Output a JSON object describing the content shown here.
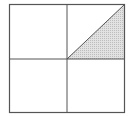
{
  "diagram": {
    "type": "geometric-figure",
    "description": "Square divided into four equal quadrants; the upper-right quadrant is split by a diagonal from the center to the top-right corner, and the lower triangle of that quadrant is shaded.",
    "square": {
      "x1": 9.5,
      "y1": 4.5,
      "x2": 124.5,
      "y2": 112.5
    },
    "center": {
      "x": 67,
      "y": 59
    },
    "stroke_color": "#555555",
    "shade_color": "#e2e2e2",
    "shade_dot_color": "#bdbdbd",
    "quadrants": [
      {
        "name": "top-left",
        "shaded": false
      },
      {
        "name": "top-right",
        "shaded": "partial",
        "diagonal": "center-to-top-right-corner",
        "shaded_region": "lower-right-triangle"
      },
      {
        "name": "bottom-left",
        "shaded": false
      },
      {
        "name": "bottom-right",
        "shaded": false
      }
    ],
    "shaded_fraction_of_square": "1/8"
  }
}
